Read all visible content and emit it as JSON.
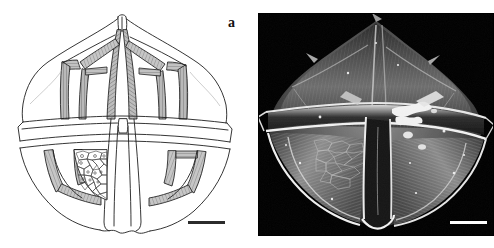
{
  "figure": {
    "caption_label": "a",
    "panels": [
      {
        "id": "drawing",
        "type": "line-drawing",
        "subject": "dinoflagellate theca, ventral view",
        "background_color": "#ffffff",
        "ink_color": "#1a1a1a",
        "has_scale_bar": true,
        "scale_bar_color": "#2b2b2b"
      },
      {
        "id": "sem",
        "type": "scanning-electron-micrograph",
        "subject": "dinoflagellate theca, ventral view",
        "background_color": "#000000",
        "has_scale_bar": true,
        "scale_bar_color": "#ffffff"
      }
    ]
  },
  "colors": {
    "page_background": "#ffffff",
    "sem_background": "#000000",
    "line_ink": "#1a1a1a",
    "suture_fill": "#a9a9a9",
    "suture_fill_light": "#c9c9c9",
    "reticulum_ink": "#3a3a3a"
  },
  "drawing_geometry": {
    "apical_horn_x": 121,
    "cingulum_top_y": 122,
    "cingulum_bottom_y": 143,
    "body_left_x": 22,
    "body_right_x": 228,
    "apex_y": 16,
    "antapex_y": 228
  }
}
